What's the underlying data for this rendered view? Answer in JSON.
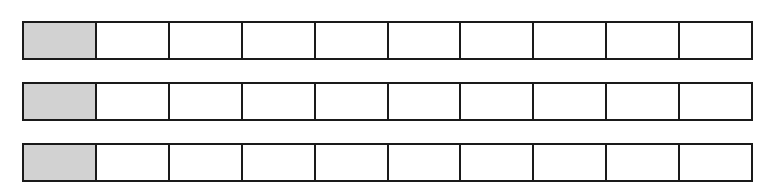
{
  "diagram": {
    "type": "fraction-strips",
    "rows": [
      {
        "cells": 10,
        "shaded": [
          0
        ]
      },
      {
        "cells": 10,
        "shaded": [
          0
        ]
      },
      {
        "cells": 10,
        "shaded": [
          0
        ]
      }
    ],
    "colors": {
      "shaded": "#d2d2d2",
      "unshaded": "#ffffff",
      "border": "#1a1a1a"
    }
  }
}
